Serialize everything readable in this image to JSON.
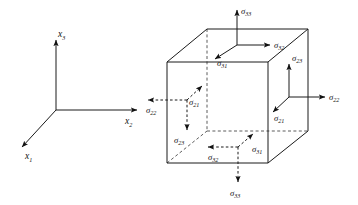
{
  "figure": {
    "background_color": "#ffffff",
    "line_color": "#1a1a1a",
    "dashed_color": "#4a4a4a"
  },
  "axes": {
    "name": "cartesian-axes-triad",
    "origin_label": "",
    "items": [
      {
        "id": "x1",
        "sym": "x",
        "sub": "1",
        "label": "x₁",
        "direction": "down-left"
      },
      {
        "id": "x2",
        "sym": "x",
        "sub": "2",
        "label": "x₂",
        "direction": "right"
      },
      {
        "id": "x3",
        "sym": "x",
        "sub": "3",
        "label": "x₃",
        "direction": "up"
      }
    ]
  },
  "cube": {
    "name": "stress-element-cube",
    "faces": [
      {
        "id": "top",
        "normal": "x3-positive",
        "visible": true
      },
      {
        "id": "right",
        "normal": "x2-positive",
        "visible": true
      },
      {
        "id": "front",
        "normal": "x1-positive",
        "visible": true
      },
      {
        "id": "bottom",
        "normal": "x3-negative",
        "visible": false
      },
      {
        "id": "left",
        "normal": "x2-negative",
        "visible": false
      },
      {
        "id": "back",
        "normal": "x1-negative",
        "visible": false
      }
    ]
  },
  "stress_labels": {
    "top_normal": {
      "sym": "σ",
      "sub": "33",
      "label": "σ₃₃",
      "face": "top",
      "direction": "up",
      "style": "solid"
    },
    "top_shear_2": {
      "sym": "σ",
      "sub": "32",
      "label": "σ₃₂",
      "face": "top",
      "direction": "right",
      "style": "solid"
    },
    "top_shear_1": {
      "sym": "σ",
      "sub": "31",
      "label": "σ₃₁",
      "face": "top",
      "direction": "down-left",
      "style": "solid"
    },
    "right_normal": {
      "sym": "σ",
      "sub": "22",
      "label": "σ₂₂",
      "face": "right",
      "direction": "right",
      "style": "solid"
    },
    "right_shear_3": {
      "sym": "σ",
      "sub": "23",
      "label": "σ₂₃",
      "face": "right",
      "direction": "up",
      "style": "solid"
    },
    "right_shear_1": {
      "sym": "σ",
      "sub": "21",
      "label": "σ₂₁",
      "face": "right",
      "direction": "down-left",
      "style": "solid"
    },
    "left_normal": {
      "sym": "σ",
      "sub": "22",
      "label": "σ₂₂",
      "face": "left",
      "direction": "left",
      "style": "dashed"
    },
    "left_shear_1": {
      "sym": "σ",
      "sub": "21",
      "label": "σ₂₁",
      "face": "left",
      "direction": "up-right",
      "style": "dashed"
    },
    "left_shear_3": {
      "sym": "σ",
      "sub": "23",
      "label": "σ₂₃",
      "face": "left",
      "direction": "down",
      "style": "dashed"
    },
    "bottom_normal": {
      "sym": "σ",
      "sub": "33",
      "label": "σ₃₃",
      "face": "bottom",
      "direction": "down",
      "style": "dashed"
    },
    "bottom_shear_2": {
      "sym": "σ",
      "sub": "32",
      "label": "σ₃₂",
      "face": "bottom",
      "direction": "left",
      "style": "dashed"
    },
    "bottom_shear_1": {
      "sym": "σ",
      "sub": "31",
      "label": "σ₃₁",
      "face": "bottom",
      "direction": "up-right",
      "style": "dashed"
    }
  }
}
